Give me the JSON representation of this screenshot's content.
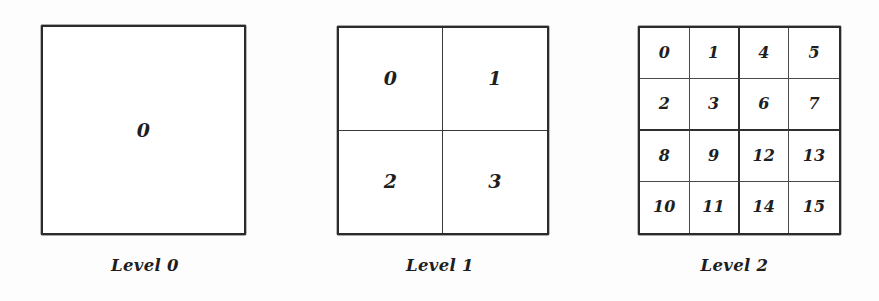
{
  "figure": {
    "background_color": "#ffffff",
    "ink_color": "#1f1f1f"
  },
  "chart_data": {
    "type": "diagram",
    "title": "",
    "panels": [
      {
        "caption": "Level 0",
        "columns": 1,
        "rows": 1,
        "cells": [
          "0"
        ]
      },
      {
        "caption": "Level 1",
        "columns": 2,
        "rows": 2,
        "cells": [
          "0",
          "1",
          "2",
          "3"
        ]
      },
      {
        "caption": "Level 2",
        "columns": 4,
        "rows": 4,
        "cells": [
          "0",
          "1",
          "4",
          "5",
          "2",
          "3",
          "6",
          "7",
          "8",
          "9",
          "12",
          "13",
          "10",
          "11",
          "14",
          "15"
        ]
      }
    ]
  }
}
